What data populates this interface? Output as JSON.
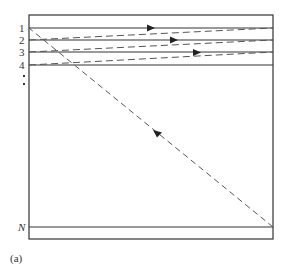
{
  "diagram": {
    "panel_label": "(a)",
    "row_labels": [
      "1",
      "2",
      "3",
      "4",
      "N"
    ],
    "ellipsis_dots": 2,
    "colors": {
      "line": "#333333",
      "dashed": "#555555",
      "background": "#ffffff"
    },
    "box": {
      "left": 29,
      "top": 15,
      "right": 273,
      "bottom": 239
    },
    "rows": [
      {
        "label": "1",
        "y": 28
      },
      {
        "label": "2",
        "y": 40
      },
      {
        "label": "3",
        "y": 52
      },
      {
        "label": "4",
        "y": 65
      },
      {
        "label": "N",
        "y": 227
      }
    ],
    "dashed_paths": [
      {
        "description": "return path row 2 left to row 1 right",
        "from": [
          29,
          40
        ],
        "to": [
          273,
          28
        ]
      },
      {
        "description": "return path row 3 left to row 2 right",
        "from": [
          29,
          52
        ],
        "to": [
          273,
          40
        ]
      },
      {
        "description": "return path row 4 left to row 3 right",
        "from": [
          29,
          65
        ],
        "to": [
          273,
          52
        ]
      },
      {
        "description": "diagonal from row N right to row 1 left",
        "from": [
          273,
          227
        ],
        "to": [
          29,
          28
        ]
      }
    ],
    "arrows": [
      {
        "at": [
          151,
          28
        ],
        "direction": "right",
        "on": "row 1 line"
      },
      {
        "at": [
          174,
          40
        ],
        "direction": "right",
        "on": "row 2 line"
      },
      {
        "at": [
          197,
          53
        ],
        "direction": "right",
        "on": "row 3 line"
      },
      {
        "at": [
          156,
          133
        ],
        "direction": "up-left",
        "on": "diagonal"
      }
    ]
  }
}
